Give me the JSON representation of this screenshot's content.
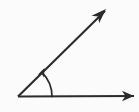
{
  "figure": {
    "kind": "geometry-angle-diagram",
    "width": 139,
    "height": 112,
    "background_color": "#fbfbfb",
    "stroke_color": "#2b2b2b",
    "arc_color": "#2b2b2b",
    "labels": [],
    "vertex": {
      "name": "angle-vertex",
      "x": 18,
      "y": 96.5
    },
    "rays": [
      {
        "name": "horizontal-ray",
        "description": "ray pointing right",
        "from_x": 18,
        "from_y": 96.5,
        "to_x": 134,
        "to_y": 96,
        "stroke_width": 2.1,
        "arrow": {
          "name": "horizontal-ray-arrowhead",
          "tip_x": 134,
          "tip_y": 96,
          "length": 12,
          "half_width": 5.2,
          "angle_deg": 0
        }
      },
      {
        "name": "diagonal-ray",
        "description": "ray pointing up and to the right",
        "from_x": 18,
        "from_y": 96.5,
        "to_x": 105,
        "to_y": 11,
        "stroke_width": 2.1,
        "angle_deg": 44.5,
        "arrow": {
          "name": "diagonal-ray-arrowhead",
          "tip_x": 106,
          "tip_y": 9,
          "length": 15,
          "half_width": 5.4,
          "angle_deg": -44.5
        }
      }
    ],
    "angle_arc": {
      "name": "angle-measure-arc",
      "description": "curved arrow sweeping from the horizontal ray up toward the diagonal ray",
      "center_x": 18,
      "center_y": 96.5,
      "radius": 34,
      "start_deg": 0,
      "end_deg": 44.5,
      "stroke_width": 1.7,
      "start_x": 52,
      "start_y": 96.5,
      "end_x": 46.5,
      "end_y": 72.5,
      "arrow": {
        "name": "angle-arc-arrowhead",
        "tip_x": 44.5,
        "tip_y": 68,
        "length": 9,
        "half_width": 3.4,
        "angle_deg": -66
      }
    }
  }
}
